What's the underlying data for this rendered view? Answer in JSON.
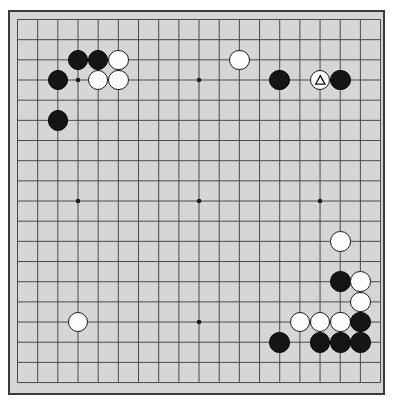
{
  "app": {
    "title": "Go Board Diagram",
    "board_label": "go-board"
  },
  "board": {
    "size": 19,
    "board_color": "#d6d6d6",
    "line_color": "#4a4a4a",
    "border_color": "#3a3a3a",
    "black_color": "#151515",
    "white_color": "#fdfdfd",
    "star_points": [
      {
        "col": 4,
        "row": 4
      },
      {
        "col": 10,
        "row": 4
      },
      {
        "col": 16,
        "row": 4
      },
      {
        "col": 4,
        "row": 10
      },
      {
        "col": 10,
        "row": 10
      },
      {
        "col": 16,
        "row": 10
      },
      {
        "col": 4,
        "row": 16
      },
      {
        "col": 10,
        "row": 16
      },
      {
        "col": 16,
        "row": 16
      }
    ],
    "stones": [
      {
        "col": 4,
        "row": 3,
        "color": "black",
        "mark": "none",
        "name": "stone-black-d17"
      },
      {
        "col": 5,
        "row": 3,
        "color": "black",
        "mark": "none",
        "name": "stone-black-e17"
      },
      {
        "col": 6,
        "row": 3,
        "color": "white",
        "mark": "none",
        "name": "stone-white-f17"
      },
      {
        "col": 3,
        "row": 4,
        "color": "black",
        "mark": "none",
        "name": "stone-black-c16"
      },
      {
        "col": 5,
        "row": 4,
        "color": "white",
        "mark": "none",
        "name": "stone-white-e16"
      },
      {
        "col": 6,
        "row": 4,
        "color": "white",
        "mark": "none",
        "name": "stone-white-f16"
      },
      {
        "col": 3,
        "row": 6,
        "color": "black",
        "mark": "none",
        "name": "stone-black-c14"
      },
      {
        "col": 12,
        "row": 3,
        "color": "white",
        "mark": "none",
        "name": "stone-white-n17"
      },
      {
        "col": 14,
        "row": 4,
        "color": "black",
        "mark": "none",
        "name": "stone-black-p16"
      },
      {
        "col": 16,
        "row": 4,
        "color": "white",
        "mark": "triangle",
        "name": "stone-white-r16-marked"
      },
      {
        "col": 17,
        "row": 4,
        "color": "black",
        "mark": "none",
        "name": "stone-black-s16"
      },
      {
        "col": 17,
        "row": 12,
        "color": "white",
        "mark": "none",
        "name": "stone-white-s8"
      },
      {
        "col": 17,
        "row": 14,
        "color": "black",
        "mark": "none",
        "name": "stone-black-s6"
      },
      {
        "col": 18,
        "row": 14,
        "color": "white",
        "mark": "none",
        "name": "stone-white-t6"
      },
      {
        "col": 18,
        "row": 15,
        "color": "white",
        "mark": "none",
        "name": "stone-white-t5"
      },
      {
        "col": 15,
        "row": 16,
        "color": "white",
        "mark": "none",
        "name": "stone-white-q4"
      },
      {
        "col": 16,
        "row": 16,
        "color": "white",
        "mark": "none",
        "name": "stone-white-r4"
      },
      {
        "col": 17,
        "row": 16,
        "color": "white",
        "mark": "none",
        "name": "stone-white-s4"
      },
      {
        "col": 18,
        "row": 16,
        "color": "black",
        "mark": "none",
        "name": "stone-black-t4"
      },
      {
        "col": 14,
        "row": 17,
        "color": "black",
        "mark": "none",
        "name": "stone-black-p3"
      },
      {
        "col": 16,
        "row": 17,
        "color": "black",
        "mark": "none",
        "name": "stone-black-r3"
      },
      {
        "col": 17,
        "row": 17,
        "color": "black",
        "mark": "none",
        "name": "stone-black-s3"
      },
      {
        "col": 18,
        "row": 17,
        "color": "black",
        "mark": "none",
        "name": "stone-black-t3"
      },
      {
        "col": 4,
        "row": 16,
        "color": "white",
        "mark": "none",
        "name": "stone-white-d4"
      }
    ]
  }
}
